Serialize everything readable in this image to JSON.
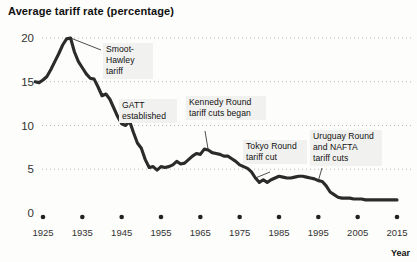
{
  "chart_data": {
    "type": "line",
    "title": "Average tariff rate (percentage)",
    "xlabel": "Year",
    "ylabel": "",
    "xlim": [
      1921,
      2017
    ],
    "ylim": [
      0,
      21
    ],
    "grid": true,
    "legend_position": "none",
    "y_ticks": [
      0,
      5,
      10,
      15,
      20
    ],
    "x_ticks": [
      1925,
      1935,
      1945,
      1955,
      1965,
      1975,
      1985,
      1995,
      2005,
      2015
    ],
    "series": [
      {
        "name": "Average tariff rate",
        "color": "#2b2b2b",
        "x": [
          1923,
          1924,
          1925,
          1926,
          1927,
          1928,
          1929,
          1930,
          1931,
          1932,
          1933,
          1934,
          1935,
          1936,
          1937,
          1938,
          1939,
          1940,
          1941,
          1942,
          1943,
          1944,
          1945,
          1946,
          1947,
          1948,
          1949,
          1950,
          1951,
          1952,
          1953,
          1954,
          1955,
          1956,
          1957,
          1958,
          1959,
          1960,
          1961,
          1962,
          1963,
          1964,
          1965,
          1966,
          1967,
          1968,
          1969,
          1970,
          1971,
          1972,
          1973,
          1974,
          1975,
          1976,
          1977,
          1978,
          1979,
          1980,
          1981,
          1982,
          1983,
          1984,
          1985,
          1986,
          1987,
          1988,
          1989,
          1990,
          1991,
          1992,
          1993,
          1994,
          1995,
          1996,
          1997,
          1998,
          1999,
          2000,
          2001,
          2002,
          2003,
          2004,
          2005,
          2006,
          2007,
          2008,
          2009,
          2010,
          2011,
          2012,
          2013,
          2014,
          2015
        ],
        "values": [
          15.0,
          14.9,
          15.2,
          15.6,
          16.4,
          17.3,
          18.2,
          19.2,
          19.9,
          20.0,
          18.4,
          17.3,
          16.6,
          15.9,
          15.4,
          15.3,
          14.4,
          13.4,
          13.6,
          13.0,
          12.0,
          11.0,
          10.2,
          10.0,
          10.5,
          9.2,
          8.0,
          7.4,
          6.1,
          5.2,
          5.3,
          4.9,
          5.3,
          5.2,
          5.3,
          5.5,
          5.9,
          5.6,
          5.7,
          6.1,
          6.5,
          6.8,
          6.7,
          7.3,
          7.2,
          6.9,
          6.8,
          6.7,
          6.5,
          6.5,
          6.2,
          5.9,
          5.5,
          5.3,
          5.1,
          4.7,
          4.0,
          3.5,
          3.8,
          3.5,
          3.8,
          4.0,
          4.2,
          4.1,
          4.0,
          4.0,
          4.1,
          4.2,
          4.2,
          4.1,
          4.0,
          3.9,
          3.7,
          3.6,
          3.1,
          2.4,
          2.1,
          1.8,
          1.7,
          1.7,
          1.7,
          1.6,
          1.6,
          1.6,
          1.5,
          1.5,
          1.5,
          1.5,
          1.5,
          1.5,
          1.5,
          1.5,
          1.5
        ]
      }
    ],
    "annotations": [
      {
        "id": "smoot-hawley",
        "text": "Smoot-\nHawley\ntariff",
        "target_year": 1932,
        "target_value": 20.0
      },
      {
        "id": "gatt",
        "text": "GATT\nestablished",
        "target_year": 1948,
        "target_value": 9.2
      },
      {
        "id": "kennedy-round",
        "text": "Kennedy Round\ntariff cuts began",
        "target_year": 1967,
        "target_value": 7.2
      },
      {
        "id": "tokyo-round",
        "text": "Tokyo Round\ntariff cut",
        "target_year": 1979,
        "target_value": 4.0
      },
      {
        "id": "uruguay-nafta",
        "text": "Uruguay Round\nand NAFTA\ntariff cuts",
        "target_year": 1995,
        "target_value": 3.7
      }
    ]
  },
  "axis": {
    "x_title": "Year",
    "y_tick_labels": [
      "20",
      "15",
      "10",
      "5",
      "0"
    ],
    "x_tick_labels": [
      "1925",
      "1935",
      "1945",
      "1955",
      "1965",
      "1975",
      "1985",
      "1995",
      "2005",
      "2015"
    ]
  },
  "annotations_text": {
    "smoot_hawley": "Smoot-\nHawley\ntariff",
    "gatt": "GATT\nestablished",
    "kennedy": "Kennedy Round\ntariff cuts began",
    "tokyo": "Tokyo Round\ntariff cut",
    "uruguay": "Uruguay Round\nand NAFTA\ntariff cuts"
  },
  "colors": {
    "line": "#2b2b2b",
    "grid": "#b9b9b9",
    "background": "#fdfdfb",
    "annotation_bg": "#f1f1ef"
  }
}
